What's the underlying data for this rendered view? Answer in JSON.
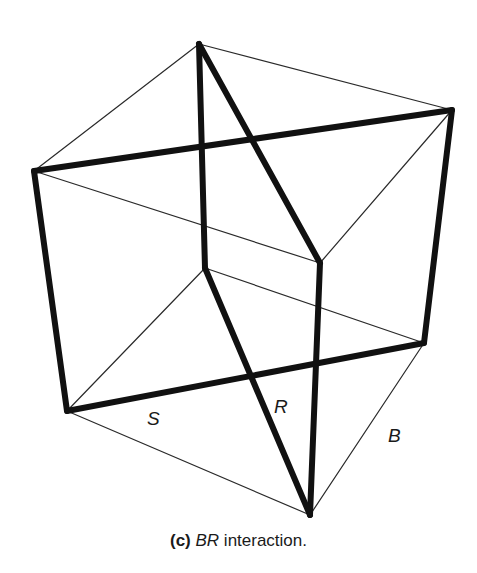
{
  "figure": {
    "caption": {
      "tag": "(c)",
      "variable": "BR",
      "text": " interaction."
    },
    "labels": {
      "S": "S",
      "R": "R",
      "B": "B"
    },
    "colors": {
      "background": "#ffffff",
      "line": "#111111"
    },
    "vertices": {
      "top": [
        199,
        44
      ],
      "left": [
        34,
        171
      ],
      "right": [
        452,
        110
      ],
      "front_top": [
        320,
        263
      ],
      "inner": [
        205,
        268
      ],
      "bottom_left": [
        67,
        411
      ],
      "bottom_right": [
        424,
        343
      ],
      "bottom_tip": [
        310,
        515
      ]
    },
    "thin_edges": [
      [
        "top",
        "left"
      ],
      [
        "top",
        "right"
      ],
      [
        "left",
        "front_top"
      ],
      [
        "right",
        "front_top"
      ],
      [
        "inner",
        "bottom_left"
      ],
      [
        "inner",
        "bottom_right"
      ],
      [
        "bottom_left",
        "bottom_tip"
      ],
      [
        "bottom_right",
        "bottom_tip"
      ]
    ],
    "thick_edges": [
      [
        "left",
        "right"
      ],
      [
        "left",
        "bottom_left"
      ],
      [
        "right",
        "bottom_right"
      ],
      [
        "bottom_left",
        "bottom_right"
      ],
      [
        "top",
        "inner"
      ],
      [
        "top",
        "front_top"
      ],
      [
        "front_top",
        "bottom_tip"
      ],
      [
        "inner",
        "bottom_tip"
      ]
    ]
  }
}
